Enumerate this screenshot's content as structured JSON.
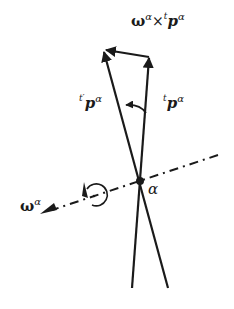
{
  "diagram": {
    "labels": {
      "cross_product": {
        "omega": "ω",
        "sup1": "α",
        "times": "×",
        "t": "t",
        "p": "p",
        "sup2": "α"
      },
      "rotated_vector": {
        "t": "t′",
        "p": "p",
        "sup": "α"
      },
      "original_vector": {
        "t": "t",
        "p": "p",
        "sup": "α"
      },
      "axis": {
        "omega": "ω",
        "sup": "α"
      },
      "pivot": "α"
    },
    "colors": {
      "stroke": "#1a1a1a",
      "background": "#ffffff"
    }
  }
}
